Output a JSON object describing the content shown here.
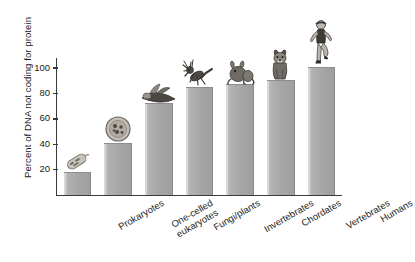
{
  "chart_data": {
    "type": "bar",
    "title": "",
    "xlabel": "",
    "ylabel": "Percent of DNA not coding for protein",
    "ylim": [
      0,
      108
    ],
    "yticks": [
      20,
      40,
      60,
      80,
      100
    ],
    "grid": false,
    "legend": "none",
    "categories": [
      "Prokaryotes",
      "One-celled eukaryotes",
      "Fungi/plants",
      "Invertebrates",
      "Chordates",
      "Vertebrates",
      "Humans"
    ],
    "values": [
      17,
      40,
      72,
      84,
      87,
      90,
      100
    ],
    "bars": [
      {
        "label_line1": "Prokaryotes",
        "label_line2": "",
        "value": 17,
        "organism": "bacterium-illustration"
      },
      {
        "label_line1": "One-celled",
        "label_line2": "eukaryotes",
        "value": 40,
        "organism": "protist-cell-illustration"
      },
      {
        "label_line1": "Fungi/plants",
        "label_line2": "",
        "value": 72,
        "organism": "plant-fungi-illustration"
      },
      {
        "label_line1": "Invertebrates",
        "label_line2": "",
        "value": 84,
        "organism": "insect-illustration"
      },
      {
        "label_line1": "Chordates",
        "label_line2": "",
        "value": 87,
        "organism": "frog-chordate-illustration"
      },
      {
        "label_line1": "Vertebrates",
        "label_line2": "",
        "value": 90,
        "organism": "dog-illustration"
      },
      {
        "label_line1": "Humans",
        "label_line2": "",
        "value": 100,
        "organism": "running-human-illustration"
      }
    ],
    "colors": {
      "bar_fill": "#a6a6a6",
      "bar_highlight": "#d8d8d8",
      "axis": "#3a3a3a",
      "text": "#1a1a1a",
      "background": "#ffffff"
    }
  }
}
